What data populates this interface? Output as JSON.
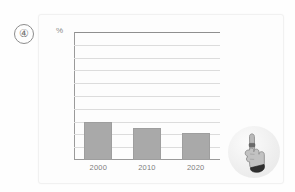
{
  "marker": {
    "label": "④"
  },
  "chart_data": {
    "type": "bar",
    "title": "",
    "subtitle": "",
    "xlabel": "",
    "ylabel": "%",
    "categories": [
      "2000",
      "2010",
      "2020"
    ],
    "values": [
      30,
      25,
      21
    ],
    "ylim": [
      0,
      100
    ],
    "yticks": [
      0,
      10,
      20,
      30,
      40,
      50,
      60,
      70,
      80,
      90,
      100
    ],
    "grid": true,
    "legend": null,
    "legend_position": "none",
    "series": [
      {
        "name": "",
        "values": [
          30,
          25,
          21
        ]
      }
    ],
    "bar_color": "#a9a9a9",
    "annotations": []
  },
  "cursor": {
    "icon": "pointing-hand-cursor",
    "halo_color": "#efefef"
  },
  "colors": {
    "bar": "#a9a9a9",
    "gridline": "#dcdcdc",
    "axis": "#9a9a9a",
    "text": "#7d7d7d",
    "card_bg": "#fdfdfd"
  }
}
